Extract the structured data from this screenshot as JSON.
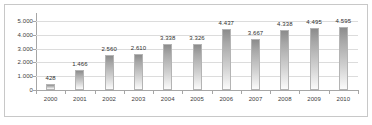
{
  "chart_data": {
    "type": "bar",
    "title": "",
    "subtitle": "",
    "xlabel": "",
    "ylabel": "",
    "categories": [
      "2000",
      "2001",
      "2002",
      "2003",
      "2004",
      "2005",
      "2006",
      "2007",
      "2008",
      "2009",
      "2010"
    ],
    "values": [
      428,
      1466,
      2560,
      2610,
      3338,
      3326,
      4437,
      3667,
      4338,
      4495,
      4595
    ],
    "data_labels": [
      "428",
      "1.466",
      "2.560",
      "2.610",
      "3.338",
      "3.326",
      "4.437",
      "3.667",
      "4.338",
      "4.495",
      "4.595"
    ],
    "ylim": [
      0,
      5500
    ],
    "yticks": [
      0,
      1000,
      2000,
      3000,
      4000,
      5000
    ],
    "ytick_labels": [
      "0",
      "1.000",
      "2.000",
      "3.000",
      "4.000",
      "5.000"
    ],
    "grid": true,
    "legend": false,
    "legend_position": "none",
    "series": [
      {
        "name": "",
        "values": [
          428,
          1466,
          2560,
          2610,
          3338,
          3326,
          4437,
          3667,
          4338,
          4495,
          4595
        ]
      }
    ],
    "colors": {
      "bar_top": "#8c8c8c",
      "bar_bottom": "#fbfbfb",
      "bar_border": "#b4b4b4",
      "gridline": "#dcdcdc",
      "axis": "#a6a6a6",
      "text": "#3c3c3c",
      "background": "#ffffff",
      "frame": "#c8c8c8"
    }
  }
}
